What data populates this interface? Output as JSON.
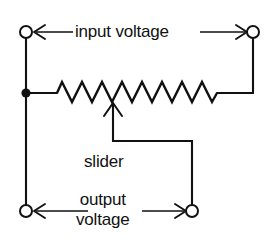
{
  "diagram": {
    "type": "electrical-schematic",
    "background_color": "#ffffff",
    "line_color": "#111111",
    "labels": {
      "input_voltage": "input voltage",
      "slider": "slider",
      "output_voltage_line1": "output",
      "output_voltage_line2": "voltage"
    },
    "components": {
      "resistor": {
        "name": "potentiometer-resistor",
        "peaks": 8
      },
      "terminals": [
        {
          "name": "terminal-top-left",
          "cx": 26,
          "cy": 32,
          "r": 6
        },
        {
          "name": "terminal-top-right",
          "cx": 253,
          "cy": 32,
          "r": 6
        },
        {
          "name": "terminal-bottom-left",
          "cx": 26,
          "cy": 211,
          "r": 6
        },
        {
          "name": "terminal-bottom-right",
          "cx": 192,
          "cy": 211,
          "r": 6
        }
      ],
      "junction": {
        "name": "junction-dot-left",
        "cx": 26,
        "cy": 93,
        "r": 4.5
      }
    },
    "measurement_arrows": [
      {
        "name": "input-voltage-arrow",
        "direction": "double",
        "y": 32
      },
      {
        "name": "output-voltage-arrow",
        "direction": "double",
        "y": 211
      }
    ]
  }
}
